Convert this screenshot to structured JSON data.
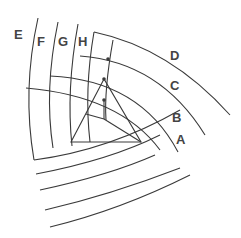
{
  "diagram": {
    "labels": {
      "A": "A",
      "B": "B",
      "C": "C",
      "D": "D",
      "E": "E",
      "F": "F",
      "G": "G",
      "H": "H"
    },
    "line_color": "#3a3a3a",
    "label_color": "#444444",
    "background": "#ffffff"
  }
}
